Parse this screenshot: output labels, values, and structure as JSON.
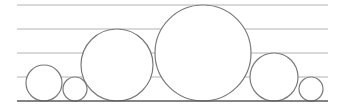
{
  "diagram": {
    "width": 342,
    "height": 107,
    "colors": {
      "guide": "#b4b4b4",
      "baseline": "#5a5a5a",
      "circle_stroke": "#7a7a7a",
      "background": "#ffffff"
    },
    "guides": [
      {
        "y": 5,
        "x1": 17,
        "x2": 328
      },
      {
        "y": 29,
        "x1": 17,
        "x2": 328
      },
      {
        "y": 53,
        "x1": 17,
        "x2": 328
      },
      {
        "y": 77,
        "x1": 17,
        "x2": 328
      }
    ],
    "baseline": {
      "y": 101,
      "x1": 17,
      "x2": 328
    },
    "circles": [
      {
        "cx": 44,
        "cy": 83,
        "r": 18
      },
      {
        "cx": 75,
        "cy": 89,
        "r": 12
      },
      {
        "cx": 117,
        "cy": 65,
        "r": 36
      },
      {
        "cx": 203,
        "cy": 53,
        "r": 48
      },
      {
        "cx": 274,
        "cy": 77,
        "r": 24
      },
      {
        "cx": 311,
        "cy": 89,
        "r": 12
      }
    ]
  }
}
